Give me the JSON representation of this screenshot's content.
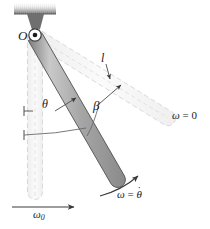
{
  "figure": {
    "type": "physics-diagram"
  },
  "labels": {
    "pivot": "O",
    "length": "l",
    "theta": "θ",
    "beta": "β",
    "omega_initial": "ω",
    "omega_initial_sub": "0",
    "omega_zero_symbol": "ω",
    "omega_zero_eq": " = 0",
    "omega_theta_symbol": "ω",
    "omega_theta_eq": " = ",
    "omega_theta_var": "θ",
    "omega_theta_dot": "˙"
  },
  "colors": {
    "rod_fill": "#a8a8a8",
    "rod_stroke": "#4a4a4a",
    "ghost_fill": "#f2f2f2",
    "ghost_stroke": "#cfcfcf",
    "ceiling_dark": "#6e6e6e",
    "ceiling_light": "#e8e8e8",
    "bracket": "#707070",
    "arc_stroke": "#8a8a8a",
    "text": "#1a1a1a",
    "background": "#ffffff"
  },
  "geometry": {
    "pivot_x": 35,
    "pivot_y": 35,
    "rod_length": 166,
    "rod_end_x": 118,
    "rod_end_y": 178,
    "ghost_rod_end_x": 171,
    "ghost_rod_end_y": 116,
    "vertical_rod_end_x": 35,
    "vertical_rod_end_y": 200,
    "theta_deg": 30,
    "beta_deg": 35
  }
}
